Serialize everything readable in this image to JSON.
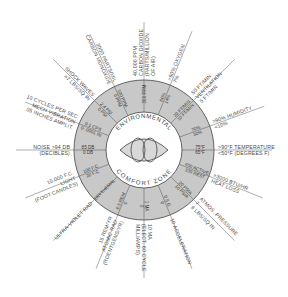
{
  "center": {
    "top_label": "ENVIRONMENTAL",
    "bottom_label": "COMFORT ZONE",
    "icon": "eye-symbol-icon"
  },
  "colors": {
    "background": "#ffffff",
    "ring_fill": "#c8c8c8",
    "ring_stroke": "#555555",
    "inner_fill": "#ffffff",
    "line": "#666666",
    "text": "#4a4a4a"
  },
  "factors": [
    {
      "id": "carbon-dioxide",
      "angle": -90,
      "outer": [
        "40,000 PPM",
        "CARBON DIOXIDE",
        "(PARTS/MILLION",
        "OF AIR)"
      ],
      "ring": [
        "300 PPM"
      ]
    },
    {
      "id": "oxygen",
      "angle": -68,
      "outer": [
        ">60%  OXYGEN",
        "7%"
      ],
      "ring": [
        "60%",
        "14%"
      ]
    },
    {
      "id": "ventilation",
      "angle": -45,
      "outer": [
        "50 FT/MIN",
        "VENTILATION",
        "5 FT/MIN"
      ],
      "ring": [
        "20 FT/MIN",
        "10 FT/MIN"
      ]
    },
    {
      "id": "humidity",
      "angle": -20,
      "outer": [
        ">90%   HUMIDITY",
        "<10%"
      ],
      "ring": [
        "70%",
        "30%"
      ]
    },
    {
      "id": "temperature",
      "angle": 0,
      "outer": [
        ">90°F TEMPERATURE",
        "<50°F (DEGREES F)"
      ],
      "ring": [
        "75°F",
        "65°F"
      ]
    },
    {
      "id": "heat-loss",
      "angle": 22,
      "outer": [
        ">3000 BTU/HR",
        "HEAT LOSS"
      ],
      "ring": [
        "450 ACTIVE",
        "330 REST"
      ]
    },
    {
      "id": "atmos-pressure",
      "angle": 45,
      "outer": [
        "ATMOS. PRESSURE",
        "7",
        "6 LBS/SQ IN"
      ],
      "ring": [
        "20 PSIA",
        "10 PSIA"
      ]
    },
    {
      "id": "acceleration",
      "angle": 68,
      "outer": [
        "10   ACCELERATION"
      ],
      "ring": [
        "0.5 G",
        "0"
      ]
    },
    {
      "id": "electric-current",
      "angle": 90,
      "outer": [
        "10 MA",
        "(ELECT. 60 CYCLE",
        "MILLIAMPS)"
      ],
      "ring": [
        "1 MA",
        "0"
      ]
    },
    {
      "id": "atomic-rad",
      "angle": 112,
      "outer": [
        "15 REM/YR",
        "ATOMIC RAD.",
        "(ROENTGENS/YR)"
      ],
      "ring": [
        "0.5 REM",
        "0"
      ]
    },
    {
      "id": "ultra-violet-rad",
      "angle": 135,
      "outer": [
        "ULTRA-VIOLET RAD"
      ],
      "ring": [
        "ERYTHEMAL"
      ]
    },
    {
      "id": "light",
      "angle": 158,
      "outer": [
        "10,000 F.C.",
        "LIGHT",
        "(FOOT CANDLES)"
      ],
      "ring": [
        "100 F.C.",
        "20 F.C."
      ]
    },
    {
      "id": "noise",
      "angle": 180,
      "outer": [
        "NOISE      >94 DB",
        "(DECIBLES)"
      ],
      "ring": [
        "85 DB",
        "0 DB"
      ]
    },
    {
      "id": "mech-vibration",
      "angle": 202,
      "outer": [
        "10 CYCLES PER SEC",
        "MECH VIBRATION",
        ".05 INCHES AMPLIT."
      ],
      "ring": [
        "0-1 CPS",
        "0-.0001 IN"
      ]
    },
    {
      "id": "shock-waves",
      "angle": 225,
      "outer": [
        "SHOCK WAVES",
        ">7 LBS/SQ IN"
      ],
      "ring": [
        "2.4 PSI",
        "0 PSI"
      ]
    },
    {
      "id": "carbon-monoxide",
      "angle": 245,
      "outer": [
        "3000 PARTS/MIL",
        "CARBON MONOXIDE"
      ],
      "ring": [
        "100 PPM",
        "0 PPM"
      ]
    }
  ]
}
